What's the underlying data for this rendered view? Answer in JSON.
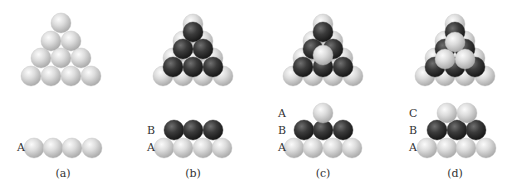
{
  "figure": {
    "colors": {
      "light_sphere": "#d4d4d4",
      "light_highlight": "#f6f6f6",
      "light_shadow": "#a8a8a8",
      "dark_sphere": "#3a3a3a",
      "dark_highlight": "#6e6e6e",
      "dark_shadow": "#1a1a1a",
      "text": "#333333"
    },
    "sphere_radius": 10,
    "panels": [
      {
        "id": "a",
        "caption": "(a)",
        "top_view": {
          "light_spheres": [
            [
              61,
              23
            ],
            [
              51,
              41
            ],
            [
              71,
              41
            ],
            [
              41,
              58
            ],
            [
              61,
              58
            ],
            [
              81,
              58
            ],
            [
              31,
              76
            ],
            [
              51,
              76
            ],
            [
              71,
              76
            ],
            [
              91,
              76
            ]
          ],
          "dark_spheres": [],
          "light_top_spheres": []
        },
        "side_view": {
          "layers": [
            {
              "label": "A",
              "color": "light",
              "label_pos": [
                17,
                151
              ],
              "spheres": [
                [
                  34,
                  148
                ],
                [
                  53,
                  148
                ],
                [
                  72,
                  148
                ],
                [
                  92,
                  148
                ]
              ]
            }
          ]
        },
        "caption_pos": [
          63,
          177
        ]
      },
      {
        "id": "b",
        "caption": "(b)",
        "top_view": {
          "light_spheres": [
            [
              193,
              24
            ],
            [
              183,
              41
            ],
            [
              203,
              41
            ],
            [
              173,
              58
            ],
            [
              193,
              58
            ],
            [
              213,
              58
            ],
            [
              163,
              76
            ],
            [
              183,
              76
            ],
            [
              203,
              76
            ],
            [
              223,
              76
            ]
          ],
          "dark_spheres": [
            [
              193,
              32
            ],
            [
              183,
              49
            ],
            [
              203,
              49
            ],
            [
              173,
              67
            ],
            [
              193,
              67
            ],
            [
              213,
              67
            ]
          ],
          "light_top_spheres": []
        },
        "side_view": {
          "layers": [
            {
              "label": "A",
              "color": "light",
              "label_pos": [
                147,
                151
              ],
              "spheres": [
                [
                  164,
                  148
                ],
                [
                  183,
                  148
                ],
                [
                  203,
                  148
                ],
                [
                  222,
                  148
                ]
              ]
            },
            {
              "label": "B",
              "color": "dark",
              "label_pos": [
                147,
                134
              ],
              "spheres": [
                [
                  174,
                  130
                ],
                [
                  193,
                  130
                ],
                [
                  213,
                  130
                ]
              ]
            }
          ]
        },
        "caption_pos": [
          193,
          177
        ]
      },
      {
        "id": "c",
        "caption": "(c)",
        "top_view": {
          "light_spheres": [
            [
              323,
              24
            ],
            [
              313,
              41
            ],
            [
              333,
              41
            ],
            [
              303,
              58
            ],
            [
              323,
              58
            ],
            [
              343,
              58
            ],
            [
              293,
              76
            ],
            [
              313,
              76
            ],
            [
              333,
              76
            ],
            [
              353,
              76
            ]
          ],
          "dark_spheres": [
            [
              323,
              32
            ],
            [
              313,
              49
            ],
            [
              333,
              49
            ],
            [
              303,
              67
            ],
            [
              323,
              67
            ],
            [
              343,
              67
            ]
          ],
          "light_top_spheres": [
            [
              323,
              55
            ]
          ]
        },
        "side_view": {
          "layers": [
            {
              "label": "A",
              "color": "light",
              "label_pos": [
                278,
                151
              ],
              "spheres": [
                [
                  294,
                  148
                ],
                [
                  313,
                  148
                ],
                [
                  333,
                  148
                ],
                [
                  352,
                  148
                ]
              ]
            },
            {
              "label": "B",
              "color": "dark",
              "label_pos": [
                278,
                134
              ],
              "spheres": [
                [
                  304,
                  130
                ],
                [
                  323,
                  130
                ],
                [
                  343,
                  130
                ]
              ]
            },
            {
              "label": "A",
              "color": "light",
              "label_pos": [
                278,
                117
              ],
              "spheres": [
                [
                  323,
                  113
                ]
              ]
            }
          ]
        },
        "caption_pos": [
          323,
          177
        ]
      },
      {
        "id": "d",
        "caption": "(d)",
        "top_view": {
          "light_spheres": [
            [
              455,
              24
            ],
            [
              445,
              41
            ],
            [
              465,
              41
            ],
            [
              435,
              58
            ],
            [
              455,
              58
            ],
            [
              475,
              58
            ],
            [
              425,
              76
            ],
            [
              445,
              76
            ],
            [
              465,
              76
            ],
            [
              485,
              76
            ]
          ],
          "dark_spheres": [
            [
              455,
              32
            ],
            [
              445,
              49
            ],
            [
              465,
              49
            ],
            [
              435,
              67
            ],
            [
              455,
              67
            ],
            [
              475,
              67
            ]
          ],
          "light_top_spheres": [
            [
              455,
              42
            ],
            [
              445,
              59
            ],
            [
              465,
              59
            ]
          ]
        },
        "side_view": {
          "layers": [
            {
              "label": "A",
              "color": "light",
              "label_pos": [
                409,
                151
              ],
              "spheres": [
                [
                  427,
                  148
                ],
                [
                  447,
                  148
                ],
                [
                  466,
                  148
                ],
                [
                  486,
                  148
                ]
              ]
            },
            {
              "label": "B",
              "color": "dark",
              "label_pos": [
                409,
                134
              ],
              "spheres": [
                [
                  437,
                  130
                ],
                [
                  457,
                  130
                ],
                [
                  476,
                  130
                ]
              ]
            },
            {
              "label": "C",
              "color": "light",
              "label_pos": [
                409,
                117
              ],
              "spheres": [
                [
                  447,
                  113
                ],
                [
                  467,
                  113
                ]
              ]
            }
          ]
        },
        "caption_pos": [
          455,
          177
        ]
      }
    ]
  }
}
